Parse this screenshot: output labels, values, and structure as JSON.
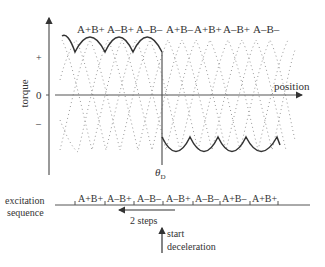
{
  "diagram": {
    "axes": {
      "y_label": "torque",
      "x_label": "position",
      "y_ticks": [
        "+",
        "0",
        "–"
      ]
    },
    "top_phase_labels": [
      "A+B+",
      "A–B+",
      "A–B–",
      "A+B–",
      "A+B+",
      "A–B+",
      "A–B–"
    ],
    "theta_label": "θ",
    "theta_subscript": "D",
    "excitation": {
      "label_line1": "excitation",
      "label_line2": "sequence",
      "steps": [
        "A+B+",
        "A–B+",
        "A–B–",
        "A–B+",
        "A–B–",
        "A+B–",
        "A+B+"
      ]
    },
    "arrow_label": "2 steps",
    "start_label_line1": "start",
    "start_label_line2": "deceleration",
    "colors": {
      "axis": "#555555",
      "solid_curve": "#333333",
      "dotted_curve": "#999999",
      "text": "#333333"
    }
  }
}
